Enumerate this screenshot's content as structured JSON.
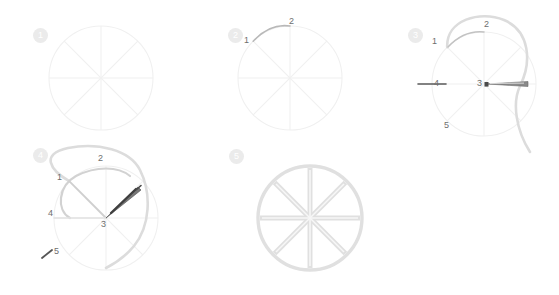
{
  "diagram": {
    "background_color": "#ffffff",
    "guide_color": "#f0f0f0",
    "thread_color": "#d8d8d8",
    "needle_color": "#555555",
    "label_color": "#6e6e6e",
    "badge_color": "#ebebeb",
    "badge_text_color": "#ffffff"
  },
  "steps": [
    {
      "number": "1",
      "caption": "",
      "labels": []
    },
    {
      "number": "2",
      "caption": "",
      "labels": [
        "1",
        "2"
      ]
    },
    {
      "number": "3",
      "caption": "",
      "labels": [
        "1",
        "2",
        "3",
        "4",
        "5"
      ]
    },
    {
      "number": "4",
      "caption": "",
      "labels": [
        "1",
        "2",
        "3",
        "4",
        "5"
      ]
    },
    {
      "number": "5",
      "caption": "",
      "labels": []
    }
  ],
  "spoke_count": 8
}
